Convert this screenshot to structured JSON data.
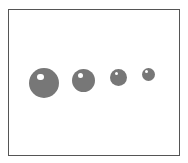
{
  "figure": {
    "frame_color": "#555555",
    "sphere_color": "#777777",
    "highlight_color": "#ffffff",
    "spheres": [
      {
        "cx": 44,
        "cy": 83,
        "r": 15
      },
      {
        "cx": 83,
        "cy": 80,
        "r": 11.5
      },
      {
        "cx": 118.5,
        "cy": 77,
        "r": 8.5
      },
      {
        "cx": 148.5,
        "cy": 74.5,
        "r": 6.5
      }
    ]
  }
}
